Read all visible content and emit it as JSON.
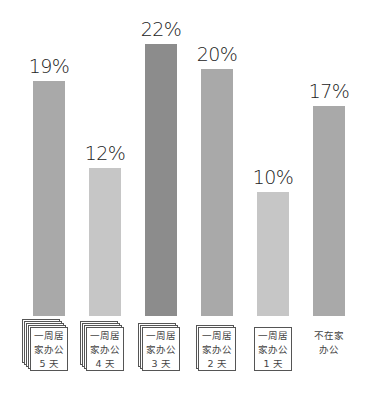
{
  "chart_data": {
    "type": "bar",
    "title": "",
    "xlabel": "",
    "ylabel": "",
    "categories": [
      "一周居家办公5天",
      "一周居家办公4天",
      "一周居家办公3天",
      "一周居家办公2天",
      "一周居家办公1天",
      "不在家办公"
    ],
    "values": [
      19,
      12,
      22,
      20,
      10,
      17
    ],
    "value_labels": [
      "19%",
      "12%",
      "22%",
      "20%",
      "10%",
      "17%"
    ],
    "ylim": [
      0,
      22
    ],
    "grid": false,
    "legend": null
  },
  "bars": [
    {
      "label_lines": [
        "一周居",
        "家办公",
        "5 天"
      ],
      "value": "19%",
      "color": "#a9a9a9",
      "stack": 4
    },
    {
      "label_lines": [
        "一周居",
        "家办公",
        "4 天"
      ],
      "value": "12%",
      "color": "#c6c6c6",
      "stack": 3
    },
    {
      "label_lines": [
        "一周居",
        "家办公",
        "3 天"
      ],
      "value": "22%",
      "color": "#8c8c8c",
      "stack": 2
    },
    {
      "label_lines": [
        "一周居",
        "家办公",
        "2 天"
      ],
      "value": "20%",
      "color": "#a9a9a9",
      "stack": 1
    },
    {
      "label_lines": [
        "一周居",
        "家办公",
        "1 天"
      ],
      "value": "10%",
      "color": "#c6c6c6",
      "stack": 0
    },
    {
      "label_lines": [
        "不在家",
        "办公"
      ],
      "value": "17%",
      "color": "#a9a9a9",
      "stack": -1
    }
  ]
}
